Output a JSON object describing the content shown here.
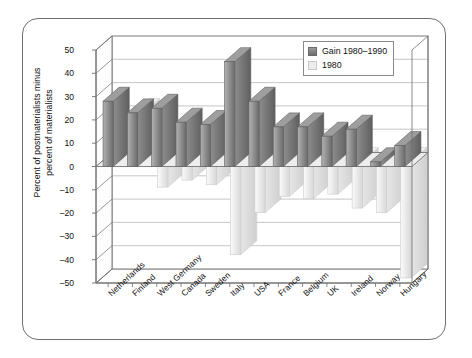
{
  "chart_data": {
    "type": "bar",
    "title": "",
    "subtitle": "",
    "xlabel": "",
    "ylabel": "Percent of postmaterialists minus percent of materialists",
    "ylabel_line1": "Percent of postmaterialists minus",
    "ylabel_line2": "percent of materialists",
    "ylim": [
      -50,
      50
    ],
    "ytick_step": 10,
    "yticks": [
      "50",
      "40",
      "30",
      "20",
      "10",
      "0",
      "-10",
      "-20",
      "-30",
      "-40",
      "-50"
    ],
    "grid": true,
    "grid_axis": "y",
    "legend_position": "top-right",
    "style": "3d-column",
    "categories": [
      "Netherlands",
      "Finland",
      "West Germany",
      "Canada",
      "Sweden",
      "Italy",
      "USA",
      "France",
      "Belgium",
      "UK",
      "Ireland",
      "Norway",
      "Hungary"
    ],
    "series": [
      {
        "name": "Gain 1980–1990",
        "color": "#808080",
        "values": [
          28,
          23,
          25,
          19,
          18,
          45,
          28,
          17,
          17,
          13,
          16,
          2,
          9
        ]
      },
      {
        "name": "1980",
        "color": "#ececec",
        "values": [
          -1,
          21,
          -11,
          -8,
          -10,
          -40,
          -22,
          -15,
          -16,
          -14,
          -20,
          -22,
          -50
        ]
      }
    ]
  },
  "legend": {
    "items": [
      {
        "label": "Gain 1980–1990",
        "swatch": "dark-gray-swatch"
      },
      {
        "label": "1980",
        "swatch": "light-gray-swatch"
      }
    ]
  },
  "colors": {
    "bar_dark": "#808080",
    "bar_light": "#ececec",
    "axis": "#6f6f6f",
    "grid": "#b8b8b8",
    "frame": "#6f6f6f",
    "text": "#111111"
  }
}
